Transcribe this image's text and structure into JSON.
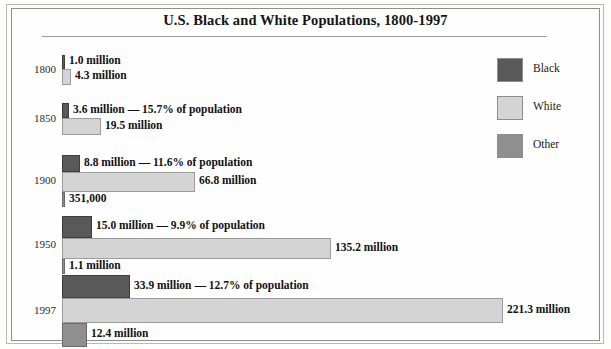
{
  "title": "U.S. Black and White Populations, 1800-1997",
  "legend": {
    "items": [
      {
        "label": "Black",
        "color": "#595959",
        "swatch_name": "legend-swatch-black"
      },
      {
        "label": "White",
        "color": "#d4d4d4",
        "swatch_name": "legend-swatch-white"
      },
      {
        "label": "Other",
        "color": "#8f8f8f",
        "swatch_name": "legend-swatch-other"
      }
    ]
  },
  "groups": [
    {
      "year": "1800",
      "bars": [
        {
          "series": "Black",
          "label": "1.0 million",
          "value_millions": 1.0,
          "percent": null
        },
        {
          "series": "White",
          "label": "4.3 million",
          "value_millions": 4.3,
          "percent": null
        }
      ]
    },
    {
      "year": "1850",
      "bars": [
        {
          "series": "Black",
          "label": "3.6 million — 15.7% of population",
          "value_millions": 3.6,
          "percent": 15.7
        },
        {
          "series": "White",
          "label": "19.5 million",
          "value_millions": 19.5,
          "percent": null
        }
      ]
    },
    {
      "year": "1900",
      "bars": [
        {
          "series": "Black",
          "label": "8.8 million — 11.6% of population",
          "value_millions": 8.8,
          "percent": 11.6
        },
        {
          "series": "White",
          "label": "66.8 million",
          "value_millions": 66.8,
          "percent": null
        },
        {
          "series": "Other",
          "label": "351,000",
          "value_millions": 0.351,
          "percent": null
        }
      ]
    },
    {
      "year": "1950",
      "bars": [
        {
          "series": "Black",
          "label": "15.0 million — 9.9% of population",
          "value_millions": 15.0,
          "percent": 9.9
        },
        {
          "series": "White",
          "label": "135.2 million",
          "value_millions": 135.2,
          "percent": null
        },
        {
          "series": "Other",
          "label": "1.1 million",
          "value_millions": 1.1,
          "percent": null
        }
      ]
    },
    {
      "year": "1997",
      "bars": [
        {
          "series": "Black",
          "label": "33.9 million — 12.7% of population",
          "value_millions": 33.9,
          "percent": 12.7
        },
        {
          "series": "White",
          "label": "221.3 million",
          "value_millions": 221.3,
          "percent": null
        },
        {
          "series": "Other",
          "label": "12.4 million",
          "value_millions": 12.4,
          "percent": null
        }
      ]
    }
  ],
  "chart_data": {
    "type": "bar",
    "orientation": "horizontal",
    "title": "U.S. Black and White Populations, 1800-1997",
    "xlabel": "",
    "ylabel": "",
    "grid": false,
    "legend_position": "right",
    "categories": [
      "1800",
      "1850",
      "1900",
      "1950",
      "1997"
    ],
    "unit": "millions of people",
    "xlim": [
      0,
      221.3
    ],
    "series": [
      {
        "name": "Black",
        "color": "#595959",
        "values": [
          1.0,
          3.6,
          8.8,
          15.0,
          33.9
        ]
      },
      {
        "name": "White",
        "color": "#d4d4d4",
        "values": [
          4.3,
          19.5,
          66.8,
          135.2,
          221.3
        ]
      },
      {
        "name": "Other",
        "color": "#8f8f8f",
        "values": [
          null,
          null,
          0.351,
          1.1,
          12.4
        ]
      }
    ],
    "data_labels": {
      "1800": {
        "Black": "1.0 million",
        "White": "4.3 million"
      },
      "1850": {
        "Black": "3.6 million — 15.7% of population",
        "White": "19.5 million"
      },
      "1900": {
        "Black": "8.8 million — 11.6% of population",
        "White": "66.8 million",
        "Other": "351,000"
      },
      "1950": {
        "Black": "15.0 million — 9.9% of population",
        "White": "135.2 million",
        "Other": "1.1 million"
      },
      "1997": {
        "Black": "33.9 million — 12.7% of population",
        "White": "221.3 million",
        "Other": "12.4 million"
      }
    },
    "annotations": [
      "Black share of population: 15.7% (1850), 11.6% (1900), 9.9% (1950), 12.7% (1997)"
    ]
  }
}
